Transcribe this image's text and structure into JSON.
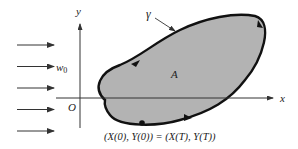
{
  "diagram": {
    "axis_labels": {
      "x": "x",
      "y": "y",
      "origin": "O"
    },
    "curve_label": "γ",
    "region_label": "A",
    "flow_label": "w",
    "flow_label_subscript": "0",
    "point_equation": "(X(0), Y(0)) = (X(T), Y(T))",
    "flow_arrow_count": 5,
    "colors": {
      "region_fill": "#b3b3b3",
      "curve_stroke": "#111111",
      "axis_stroke": "#333333",
      "arrow_stroke": "#333333"
    }
  }
}
